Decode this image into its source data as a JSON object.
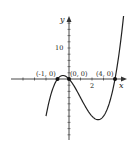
{
  "chart_data": {
    "type": "line",
    "title": "",
    "function": "y = x(x+1)(x-4)",
    "xlabel": "x",
    "ylabel": "y",
    "x_tick_labels": [
      "2"
    ],
    "y_tick_labels": [
      "10"
    ],
    "xlim": [
      -5.5,
      5.6
    ],
    "ylim": [
      -19,
      20
    ],
    "grid": false,
    "legend": null,
    "marked_points": [
      {
        "label": "(-1, 0)",
        "x": -1,
        "y": 0
      },
      {
        "label": "(0, 0)",
        "x": 0,
        "y": 0
      },
      {
        "label": "(4, 0)",
        "x": 4,
        "y": 0
      }
    ],
    "series": [
      {
        "name": "cubic",
        "x": [
          -1.8,
          -1.5,
          -1.0,
          -0.5,
          0.0,
          0.5,
          1.0,
          1.5,
          2.0,
          2.5,
          2.87,
          3.0,
          3.5,
          4.0,
          4.5,
          5.0,
          5.3
        ],
        "values": [
          -19.0,
          -12.4,
          0.0,
          1.1,
          0.0,
          -2.6,
          -6.0,
          -9.4,
          -12.0,
          -13.1,
          -13.1,
          -12.0,
          -8.8,
          0.0,
          12.4,
          30.0,
          41.3
        ]
      }
    ]
  },
  "labels": {
    "x_axis": "x",
    "y_axis": "y",
    "x_tick": "2",
    "y_tick": "10",
    "point_a": "(-1, 0)",
    "point_b": "(0, 0)",
    "point_c": "(4, 0)"
  },
  "colors": {
    "curve": "#222222",
    "axis": "#333333",
    "point": "#111111"
  }
}
